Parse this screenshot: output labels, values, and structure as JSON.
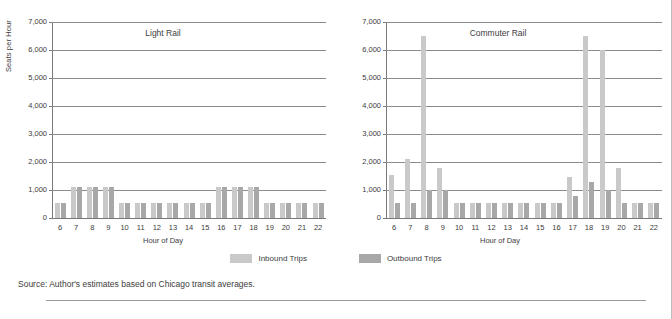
{
  "figure": {
    "source_note": "Source: Author's estimates based on Chicago transit averages."
  },
  "legend": {
    "items": [
      {
        "label": "Inbound Trips",
        "color": "#c9c9c9",
        "swatch": "legend-swatch-inbound"
      },
      {
        "label": "Outbound Trips",
        "color": "#a8a8a8",
        "swatch": "legend-swatch-outbound"
      }
    ]
  },
  "axes": {
    "ylabel": "Seats per Hour",
    "xlabel": "Hour of Day",
    "yticks": [
      "0",
      "1,000",
      "2,000",
      "3,000",
      "4,000",
      "5,000",
      "6,000",
      "7,000"
    ],
    "ytick_values": [
      0,
      1000,
      2000,
      3000,
      4000,
      5000,
      6000,
      7000
    ],
    "ylim": [
      0,
      7000
    ],
    "xticks": [
      "6",
      "7",
      "8",
      "9",
      "10",
      "11",
      "12",
      "13",
      "14",
      "15",
      "16",
      "17",
      "18",
      "19",
      "20",
      "21",
      "22"
    ]
  },
  "chart_data": [
    {
      "type": "bar",
      "title": "Light Rail",
      "xlabel": "Hour of Day",
      "ylabel": "Seats per Hour",
      "ylim": [
        0,
        7000
      ],
      "grid": true,
      "legend_position": "bottom-center",
      "categories": [
        6,
        7,
        8,
        9,
        10,
        11,
        12,
        13,
        14,
        15,
        16,
        17,
        18,
        19,
        20,
        21,
        22
      ],
      "series": [
        {
          "name": "Inbound Trips",
          "color": "#c9c9c9",
          "values": [
            550,
            1100,
            1100,
            1100,
            550,
            550,
            550,
            550,
            550,
            550,
            1100,
            1100,
            1100,
            550,
            550,
            550,
            550
          ]
        },
        {
          "name": "Outbound Trips",
          "color": "#a8a8a8",
          "values": [
            550,
            1100,
            1100,
            1100,
            550,
            550,
            550,
            550,
            550,
            550,
            1100,
            1100,
            1100,
            550,
            550,
            550,
            550
          ]
        }
      ]
    },
    {
      "type": "bar",
      "title": "Commuter Rail",
      "xlabel": "Hour of Day",
      "ylabel": "Seats per Hour",
      "ylim": [
        0,
        7000
      ],
      "grid": true,
      "legend_position": "bottom-center",
      "categories": [
        6,
        7,
        8,
        9,
        10,
        11,
        12,
        13,
        14,
        15,
        16,
        17,
        18,
        19,
        20,
        21,
        22
      ],
      "series": [
        {
          "name": "Inbound Trips",
          "color": "#c9c9c9",
          "values": [
            1550,
            2100,
            6500,
            1800,
            550,
            550,
            550,
            550,
            550,
            550,
            550,
            1450,
            6500,
            6000,
            1800,
            550,
            550
          ]
        },
        {
          "name": "Outbound Trips",
          "color": "#a8a8a8",
          "values": [
            550,
            550,
            1000,
            1000,
            550,
            550,
            550,
            550,
            550,
            550,
            550,
            800,
            1300,
            1000,
            550,
            550,
            550
          ]
        }
      ]
    }
  ]
}
